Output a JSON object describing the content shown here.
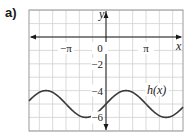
{
  "part_label": "a)",
  "chart_data": {
    "type": "line",
    "title": "",
    "xlabel": "x",
    "ylabel": "y",
    "function_label": "h(x)",
    "function": "h(x) = sin(x) - 5",
    "x_tick_labels": [
      "−π",
      "0",
      "π"
    ],
    "x_tick_values": [
      -3.1416,
      0,
      3.1416
    ],
    "y_tick_labels": [
      "−2",
      "−4",
      "−6"
    ],
    "y_tick_values": [
      -2,
      -4,
      -6
    ],
    "xlim": [
      -5.97,
      6.07
    ],
    "ylim": [
      -7.1,
      2.0
    ],
    "grid": true,
    "grid_x_step": "π/3",
    "grid_y_step": 1,
    "series": [
      {
        "name": "h(x)",
        "x": [
          -5.97,
          -4.71,
          -3.14,
          -1.57,
          0,
          1.57,
          3.14,
          4.71,
          6.07
        ],
        "values": [
          -4.7,
          -4,
          -5,
          -6,
          -5,
          -4,
          -5,
          -6,
          -5.2
        ]
      }
    ],
    "colors": {
      "grid": "#d0d0d0",
      "axis": "#1a1a1a",
      "curve": "#3a3a3a",
      "frame": "#9a9a9a"
    }
  }
}
